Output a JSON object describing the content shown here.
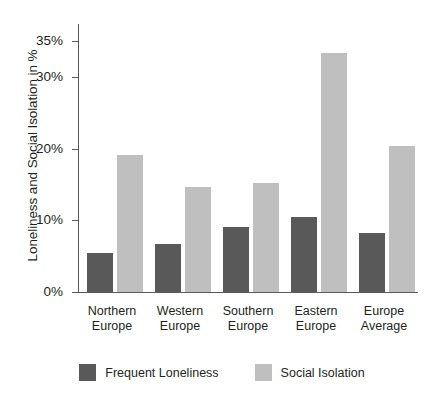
{
  "chart_data": {
    "type": "bar",
    "title": "",
    "xlabel": "",
    "ylabel": "Loneliness and Social Isolation in %",
    "ylim": [
      0,
      35
    ],
    "grid": false,
    "legend_position": "bottom",
    "categories": [
      "Northern Europe",
      "Western Europe",
      "Southern Europe",
      "Eastern Europe",
      "Europe Average"
    ],
    "category_lines": [
      [
        "Northern",
        "Europe"
      ],
      [
        "Western",
        "Europe"
      ],
      [
        "Southern",
        "Europe"
      ],
      [
        "Eastern",
        "Europe"
      ],
      [
        "Europe",
        "Average"
      ]
    ],
    "ticks": [
      "0%",
      "10%",
      "20%",
      "30%",
      "35%"
    ],
    "tick_values": [
      0,
      10,
      20,
      30,
      35
    ],
    "series": [
      {
        "name": "Frequent Loneliness",
        "color": "#595959",
        "values": [
          5.4,
          6.7,
          9.0,
          10.5,
          8.3
        ]
      },
      {
        "name": "Social Isolation",
        "color": "#bfbfbf",
        "values": [
          19.1,
          14.7,
          15.2,
          33.3,
          20.4
        ]
      }
    ]
  },
  "axis": {
    "line_color": "#58595b"
  }
}
